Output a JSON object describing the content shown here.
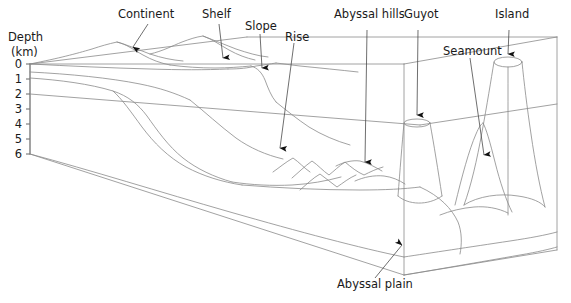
{
  "figure": {
    "axis": {
      "name": "Depth",
      "unit": "(km)",
      "ticks": [
        "0",
        "1",
        "2",
        "3",
        "4",
        "5",
        "6"
      ],
      "min": 0,
      "max": 6
    },
    "labels": [
      {
        "id": "continent",
        "text": "Continent"
      },
      {
        "id": "shelf",
        "text": "Shelf"
      },
      {
        "id": "slope",
        "text": "Slope"
      },
      {
        "id": "rise",
        "text": "Rise"
      },
      {
        "id": "abyssal-hills",
        "text": "Abyssal hills"
      },
      {
        "id": "guyot",
        "text": "Guyot"
      },
      {
        "id": "seamount",
        "text": "Seamount"
      },
      {
        "id": "island",
        "text": "Island"
      },
      {
        "id": "abyssal-plain",
        "text": "Abyssal plain"
      }
    ],
    "colors": {
      "terrain_line": "#8a8a8a",
      "axis_line": "#555555",
      "text": "#1a1a1a",
      "arrow": "#111111",
      "background": "#ffffff"
    }
  }
}
